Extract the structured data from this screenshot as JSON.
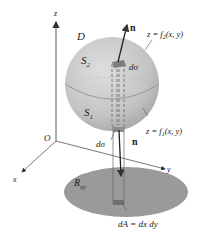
{
  "diagram": {
    "labels": {
      "z_axis": "z",
      "x_axis": "x",
      "y_axis": "y",
      "origin": "O",
      "region_D": "D",
      "upper_surface": "S",
      "upper_surface_sub": "2",
      "lower_surface": "S",
      "lower_surface_sub": "1",
      "upper_eq_prefix": "z = f",
      "upper_eq_sub": "2",
      "upper_eq_suffix": "(x, y)",
      "lower_eq_prefix": "z = f",
      "lower_eq_sub": "1",
      "lower_eq_suffix": "(x, y)",
      "normal_top": "n",
      "normal_bottom": "n",
      "dsigma_top": "dσ",
      "dsigma_bottom": "dσ",
      "region_Rxy": "R",
      "region_Rxy_sub": "xy",
      "area_element": "dA = dx dy"
    },
    "colors": {
      "sphere": "#c8c8c8",
      "sphere_shade": "#a9a9a9",
      "region": "#9a9a9a",
      "axis": "#555555",
      "patch": "#7d7d7d"
    }
  }
}
